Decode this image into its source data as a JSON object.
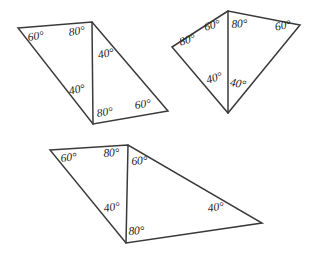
{
  "figure": {
    "background_color": "#ffffff",
    "stroke_color": "#3a3a3a",
    "label_color": "#1a1a1a",
    "degree_symbol": "°",
    "shapes": [
      {
        "name": "quadrilateral-top-left",
        "vertices": [
          [
            18,
            28
          ],
          [
            92,
            22
          ],
          [
            168,
            111
          ],
          [
            93,
            124
          ]
        ],
        "diagonal": [
          [
            92,
            22
          ],
          [
            93,
            124
          ]
        ],
        "labels": [
          {
            "id": "tl-a",
            "text": "60°",
            "x": 27,
            "y": 32,
            "rotate": -8
          },
          {
            "id": "tl-b",
            "text": "80°",
            "x": 68,
            "y": 27,
            "rotate": -8
          },
          {
            "id": "tl-c",
            "text": "40°",
            "x": 97,
            "y": 50,
            "rotate": -12
          },
          {
            "id": "tl-d",
            "text": "40°",
            "x": 68,
            "y": 86,
            "rotate": -12
          },
          {
            "id": "tl-e",
            "text": "80°",
            "x": 96,
            "y": 108,
            "rotate": -8
          },
          {
            "id": "tl-f",
            "text": "60°",
            "x": 134,
            "y": 100,
            "rotate": -8
          }
        ]
      },
      {
        "name": "quadrilateral-top-right",
        "vertices": [
          [
            228,
            11
          ],
          [
            172,
            47
          ],
          [
            228,
            113
          ],
          [
            300,
            25
          ]
        ],
        "diagonal": [
          [
            228,
            11
          ],
          [
            228,
            113
          ]
        ],
        "labels": [
          {
            "id": "tr-a",
            "text": "60°",
            "x": 203,
            "y": 22,
            "rotate": -14
          },
          {
            "id": "tr-b",
            "text": "80°",
            "x": 231,
            "y": 19,
            "rotate": -4
          },
          {
            "id": "tr-c",
            "text": "60°",
            "x": 274,
            "y": 22,
            "rotate": -12
          },
          {
            "id": "tr-d",
            "text": "80°",
            "x": 178,
            "y": 37,
            "rotate": -16
          },
          {
            "id": "tr-e",
            "text": "40°",
            "x": 205,
            "y": 75,
            "rotate": -16
          },
          {
            "id": "tr-f",
            "text": "40°",
            "x": 231,
            "y": 77,
            "rotate": 10
          }
        ]
      },
      {
        "name": "quadrilateral-bottom",
        "vertices": [
          [
            50,
            150
          ],
          [
            128,
            145
          ],
          [
            262,
            223
          ],
          [
            126,
            243
          ]
        ],
        "diagonal": [
          [
            128,
            145
          ],
          [
            126,
            243
          ]
        ],
        "labels": [
          {
            "id": "bt-a",
            "text": "60°",
            "x": 60,
            "y": 153,
            "rotate": -6
          },
          {
            "id": "bt-b",
            "text": "80°",
            "x": 103,
            "y": 148,
            "rotate": -4
          },
          {
            "id": "bt-c",
            "text": "60°",
            "x": 131,
            "y": 156,
            "rotate": -4
          },
          {
            "id": "bt-d",
            "text": "40°",
            "x": 103,
            "y": 203,
            "rotate": -8
          },
          {
            "id": "bt-e",
            "text": "80°",
            "x": 128,
            "y": 226,
            "rotate": -4
          },
          {
            "id": "bt-f",
            "text": "40°",
            "x": 207,
            "y": 203,
            "rotate": -8
          }
        ]
      }
    ]
  }
}
